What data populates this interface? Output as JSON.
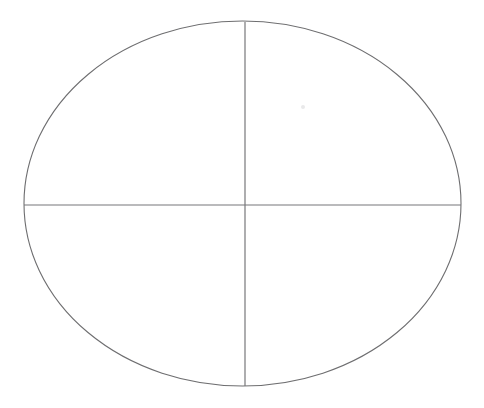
{
  "figure": {
    "background_color": "#ffffff",
    "canvas": {
      "width": 484,
      "height": 408
    },
    "stroke_color": "#6e6e70",
    "axis_color": "#77777a",
    "stroke_width": 1.1
  },
  "chart_data": {
    "type": "diagram",
    "title": "",
    "subtitle": "",
    "xlabel": "",
    "ylabel": "",
    "grid": false,
    "legend": "none",
    "shapes": [
      {
        "name": "ellipse-outline",
        "kind": "ellipse",
        "cx": 242.5,
        "cy": 203.5,
        "rx": 218.5,
        "ry": 182.5,
        "left": 24,
        "right": 461,
        "top": 21,
        "bottom": 386,
        "fill": "none",
        "stroke": "#6e6e70"
      },
      {
        "name": "vertical-axis",
        "kind": "line",
        "x1": 245,
        "y1": 22,
        "x2": 245,
        "y2": 386,
        "stroke": "#77777a"
      },
      {
        "name": "horizontal-axis",
        "kind": "line",
        "x1": 24,
        "y1": 205,
        "x2": 461,
        "y2": 205,
        "stroke": "#77777a"
      }
    ],
    "intersection_point": {
      "x": 245,
      "y": 205
    },
    "quadrants": [
      {
        "name": "upper-left"
      },
      {
        "name": "upper-right"
      },
      {
        "name": "lower-left"
      },
      {
        "name": "lower-right"
      }
    ]
  },
  "artifacts": [
    {
      "name": "scan-speck",
      "cx": 303,
      "cy": 107,
      "r": 2.0
    }
  ]
}
